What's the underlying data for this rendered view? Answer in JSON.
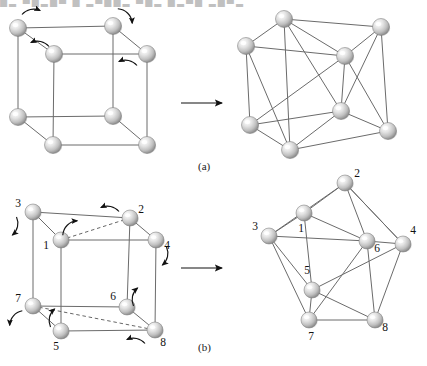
{
  "page": {
    "width": 427,
    "height": 366,
    "background": "#ffffff",
    "cropped_header_text": "█▄ ▀█▄█▀ █ ▄▀██▄ ▀█▄ █▄▀█ ▄█▀▄",
    "figure_type": "graph-embedding-diagram",
    "colors": {
      "edge": "#6b6b6b",
      "dashed_edge": "#555555",
      "arrow": "#111111",
      "node_light": "#ffffff",
      "node_mid": "#cfcfcf",
      "node_dark": "#8a8a8a",
      "node_outline": "#7d7d7d",
      "label": "#111111",
      "caption": "#1a1a1a",
      "background": "#ffffff"
    }
  },
  "panels": [
    {
      "id": "a",
      "caption": "(a)",
      "caption_pos": {
        "x": 198,
        "y": 160
      },
      "transition_arrow": {
        "x1": 181,
        "y1": 103,
        "x2": 222,
        "y2": 103
      },
      "left_figure": {
        "name": "cube-graph-unlabeled",
        "nodes": [
          {
            "id": "tfl",
            "x": 18,
            "y": 28,
            "r": 8.5
          },
          {
            "id": "tbl",
            "x": 54,
            "y": 54,
            "r": 8.5
          },
          {
            "id": "tbr",
            "x": 147,
            "y": 54,
            "r": 8.5
          },
          {
            "id": "tfr",
            "x": 113,
            "y": 26,
            "r": 8.5
          },
          {
            "id": "bfl",
            "x": 18,
            "y": 117,
            "r": 8.5
          },
          {
            "id": "bbl",
            "x": 53,
            "y": 145,
            "r": 8.5
          },
          {
            "id": "bbr",
            "x": 147,
            "y": 145,
            "r": 8.5
          },
          {
            "id": "bfr",
            "x": 113,
            "y": 116,
            "r": 8.5
          }
        ],
        "edges": [
          [
            "tfl",
            "tfr"
          ],
          [
            "tfr",
            "tbr"
          ],
          [
            "tbr",
            "tbl"
          ],
          [
            "tbl",
            "tfl"
          ],
          [
            "bfl",
            "bfr"
          ],
          [
            "bfr",
            "bbr"
          ],
          [
            "bbr",
            "bbl"
          ],
          [
            "bbl",
            "bfl"
          ],
          [
            "tfl",
            "bfl"
          ],
          [
            "tfr",
            "bfr"
          ],
          [
            "tbr",
            "bbr"
          ],
          [
            "tbl",
            "bbl"
          ]
        ],
        "dashed_edges": [],
        "arrows": [
          {
            "cx": 31,
            "cy": 12,
            "sweep": 1,
            "dir": "right"
          },
          {
            "cx": 125,
            "cy": 16,
            "sweep": 1,
            "dir": "down-right"
          },
          {
            "cx": 40,
            "cy": 44,
            "sweep": 0,
            "dir": "left"
          },
          {
            "cx": 128,
            "cy": 63,
            "sweep": 0,
            "dir": "left"
          }
        ]
      },
      "right_figure": {
        "name": "planar-embedding-unlabeled",
        "nodes": [
          {
            "id": "n1",
            "x": 284,
            "y": 19,
            "r": 8.5
          },
          {
            "id": "n2",
            "x": 381,
            "y": 27,
            "r": 8.5
          },
          {
            "id": "n3",
            "x": 246,
            "y": 46,
            "r": 8.5
          },
          {
            "id": "n4",
            "x": 345,
            "y": 56,
            "r": 8.5
          },
          {
            "id": "n5",
            "x": 250,
            "y": 125,
            "r": 8.5
          },
          {
            "id": "n6",
            "x": 341,
            "y": 111,
            "r": 8.5
          },
          {
            "id": "n7",
            "x": 290,
            "y": 150,
            "r": 8.5
          },
          {
            "id": "n8",
            "x": 388,
            "y": 131,
            "r": 8.5
          }
        ],
        "edges": [
          [
            "n1",
            "n2"
          ],
          [
            "n1",
            "n3"
          ],
          [
            "n1",
            "n4"
          ],
          [
            "n2",
            "n4"
          ],
          [
            "n3",
            "n4"
          ],
          [
            "n2",
            "n8"
          ],
          [
            "n3",
            "n5"
          ],
          [
            "n5",
            "n7"
          ],
          [
            "n7",
            "n8"
          ],
          [
            "n6",
            "n8"
          ],
          [
            "n5",
            "n6"
          ],
          [
            "n1",
            "n7"
          ],
          [
            "n3",
            "n7"
          ],
          [
            "n4",
            "n6"
          ],
          [
            "n2",
            "n6"
          ],
          [
            "n1",
            "n6"
          ],
          [
            "n4",
            "n8"
          ],
          [
            "n5",
            "n4"
          ],
          [
            "n6",
            "n7"
          ]
        ]
      }
    },
    {
      "id": "b",
      "caption": "(b)",
      "caption_pos": {
        "x": 198,
        "y": 341
      },
      "transition_arrow": {
        "x1": 181,
        "y1": 268,
        "x2": 222,
        "y2": 268
      },
      "left_figure": {
        "name": "cube-graph-labeled",
        "nodes": [
          {
            "id": "3",
            "label": "3",
            "x": 33,
            "y": 212,
            "r": 8.0,
            "lx": 18,
            "ly": 207
          },
          {
            "id": "1",
            "label": "1",
            "x": 61,
            "y": 240,
            "r": 8.0,
            "lx": 46,
            "ly": 249
          },
          {
            "id": "2",
            "label": "2",
            "x": 130,
            "y": 218,
            "r": 8.0,
            "lx": 141,
            "ly": 213
          },
          {
            "id": "4",
            "label": "4",
            "x": 156,
            "y": 240,
            "r": 8.0,
            "lx": 167,
            "ly": 249
          },
          {
            "id": "7",
            "label": "7",
            "x": 33,
            "y": 306,
            "r": 8.0,
            "lx": 18,
            "ly": 302
          },
          {
            "id": "5",
            "label": "5",
            "x": 61,
            "y": 331,
            "r": 8.0,
            "lx": 56,
            "ly": 350
          },
          {
            "id": "6",
            "label": "6",
            "x": 127,
            "y": 307,
            "r": 8.0,
            "lx": 113,
            "ly": 300
          },
          {
            "id": "8",
            "label": "8",
            "x": 155,
            "y": 330,
            "r": 8.0,
            "lx": 163,
            "ly": 346
          }
        ],
        "edges": [
          [
            "3",
            "2"
          ],
          [
            "2",
            "4"
          ],
          [
            "3",
            "1"
          ],
          [
            "1",
            "4"
          ],
          [
            "7",
            "6"
          ],
          [
            "6",
            "8"
          ],
          [
            "7",
            "5"
          ],
          [
            "5",
            "8"
          ],
          [
            "3",
            "7"
          ],
          [
            "1",
            "5"
          ],
          [
            "2",
            "6"
          ],
          [
            "4",
            "8"
          ]
        ],
        "dashed_edges": [
          [
            "1",
            "2"
          ],
          [
            "7",
            "8"
          ]
        ],
        "arrows": [
          {
            "cx": 110,
            "cy": 209,
            "sweep": 0,
            "dir": "left"
          },
          {
            "cx": 70,
            "cy": 228,
            "sweep": 1,
            "dir": "up-right"
          },
          {
            "cx": 14,
            "cy": 226,
            "sweep": 1,
            "dir": "down"
          },
          {
            "cx": 164,
            "cy": 256,
            "sweep": 1,
            "dir": "down"
          },
          {
            "cx": 136,
            "cy": 297,
            "sweep": 1,
            "dir": "up"
          },
          {
            "cx": 53,
            "cy": 318,
            "sweep": 1,
            "dir": "up"
          },
          {
            "cx": 16,
            "cy": 318,
            "sweep": 0,
            "dir": "down-left"
          },
          {
            "cx": 136,
            "cy": 341,
            "sweep": 0,
            "dir": "left"
          }
        ]
      },
      "right_figure": {
        "name": "planar-embedding-labeled",
        "nodes": [
          {
            "id": "2",
            "label": "2",
            "x": 345,
            "y": 183,
            "r": 8.0,
            "lx": 357,
            "ly": 177
          },
          {
            "id": "1",
            "label": "1",
            "x": 304,
            "y": 213,
            "r": 8.0,
            "lx": 301,
            "ly": 232
          },
          {
            "id": "3",
            "label": "3",
            "x": 269,
            "y": 236,
            "r": 8.0,
            "lx": 255,
            "ly": 230
          },
          {
            "id": "6",
            "label": "6",
            "x": 367,
            "y": 241,
            "r": 8.0,
            "lx": 377,
            "ly": 252
          },
          {
            "id": "4",
            "label": "4",
            "x": 403,
            "y": 244,
            "r": 8.0,
            "lx": 413,
            "ly": 234
          },
          {
            "id": "5",
            "label": "5",
            "x": 312,
            "y": 290,
            "r": 8.0,
            "lx": 307,
            "ly": 274
          },
          {
            "id": "7",
            "label": "7",
            "x": 309,
            "y": 320,
            "r": 8.0,
            "lx": 311,
            "ly": 340
          },
          {
            "id": "8",
            "label": "8",
            "x": 375,
            "y": 320,
            "r": 8.0,
            "lx": 385,
            "ly": 331
          }
        ],
        "edges": [
          [
            "2",
            "1"
          ],
          [
            "2",
            "3"
          ],
          [
            "2",
            "6"
          ],
          [
            "2",
            "4"
          ],
          [
            "1",
            "3"
          ],
          [
            "1",
            "6"
          ],
          [
            "1",
            "5"
          ],
          [
            "3",
            "5"
          ],
          [
            "3",
            "7"
          ],
          [
            "3",
            "6"
          ],
          [
            "6",
            "4"
          ],
          [
            "6",
            "8"
          ],
          [
            "6",
            "7"
          ],
          [
            "4",
            "8"
          ],
          [
            "4",
            "5"
          ],
          [
            "4",
            "2"
          ],
          [
            "5",
            "7"
          ],
          [
            "5",
            "8"
          ],
          [
            "7",
            "8"
          ]
        ]
      }
    }
  ],
  "chart_data": {
    "type": "diagram",
    "vertex_count": 8,
    "edge_count": 12,
    "vertex_labels": [
      "1",
      "2",
      "3",
      "4",
      "5",
      "6",
      "7",
      "8"
    ],
    "panel_captions": [
      "(a)",
      "(b)"
    ]
  }
}
